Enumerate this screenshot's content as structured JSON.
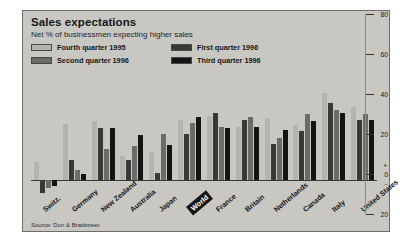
{
  "chart": {
    "title": "Sales expectations",
    "subtitle": "Net % of businessmen expecting higher sales",
    "source": "Source: Dun & Bradstreet"
  },
  "legend": [
    {
      "label": "Fourth quarter 1995",
      "color": "#b5b3ae"
    },
    {
      "label": "First quarter 1996",
      "color": "#3a3835"
    },
    {
      "label": "Second quarter 1996",
      "color": "#6d6b67"
    },
    {
      "label": "Third quarter 1996",
      "color": "#141414"
    }
  ],
  "axis": {
    "ticks": [
      "80",
      "60",
      "40",
      "20",
      "0",
      "20"
    ],
    "plus_sign": "+",
    "minus_sign": "-",
    "zero_label": "0"
  },
  "chart_data": {
    "type": "bar",
    "title": "Sales expectations",
    "subtitle": "Net % of businessmen expecting higher sales",
    "xlabel": "",
    "ylabel": "Net % of businessmen expecting higher sales",
    "ylim": [
      -20,
      80
    ],
    "grid": false,
    "legend_position": "top-left",
    "categories": [
      "Switz.",
      "Germany",
      "New Zealand",
      "Australia",
      "Japan",
      "World",
      "France",
      "Britain",
      "Netherlands",
      "Canada",
      "Italy",
      "United States"
    ],
    "highlight_category": "World",
    "series": [
      {
        "name": "Fourth quarter 1995",
        "color": "#b5b3ae",
        "values": [
          13,
          40,
          42,
          17,
          20,
          43,
          46,
          38,
          44,
          39,
          62,
          52
        ]
      },
      {
        "name": "First quarter 1996",
        "color": "#3a3835",
        "values": [
          -9,
          14,
          37,
          14,
          5,
          33,
          48,
          43,
          26,
          35,
          55,
          43
        ]
      },
      {
        "name": "Second quarter 1996",
        "color": "#6d6b67",
        "values": [
          -6,
          7,
          22,
          24,
          33,
          41,
          38,
          45,
          30,
          47,
          50,
          47
        ]
      },
      {
        "name": "Third quarter 1996",
        "color": "#141414",
        "values": [
          -4,
          4,
          37,
          32,
          25,
          45,
          37,
          38,
          36,
          42,
          48,
          43
        ]
      }
    ]
  }
}
